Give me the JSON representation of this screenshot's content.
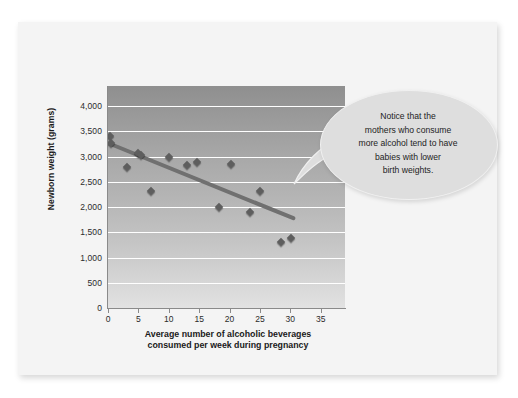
{
  "chart_data": {
    "type": "scatter",
    "title": "",
    "xlabel": "Average number of alcoholic beverages consumed per week during pregnancy",
    "xlabel_line1": "Average number of alcoholic beverages",
    "xlabel_line2": "consumed per week during pregnancy",
    "ylabel": "Newborn weight (grams)",
    "xlim": [
      0,
      39
    ],
    "ylim": [
      0,
      4400
    ],
    "grid": true,
    "legend": null,
    "x_ticks": [
      0,
      5,
      10,
      15,
      20,
      25,
      30,
      35
    ],
    "x_tick_labels": [
      "0",
      "5",
      "10",
      "15",
      "20",
      "25",
      "30",
      "35"
    ],
    "y_ticks": [
      0,
      500,
      1000,
      1500,
      2000,
      2500,
      3000,
      3500,
      4000
    ],
    "y_tick_labels": [
      "0",
      "500",
      "1,000",
      "1,500",
      "2,000",
      "2,500",
      "3,000",
      "3,500",
      "4,000"
    ],
    "points": [
      {
        "x": 0.3,
        "y": 3400
      },
      {
        "x": 0.5,
        "y": 3280
      },
      {
        "x": 3.2,
        "y": 2790
      },
      {
        "x": 5.0,
        "y": 3080
      },
      {
        "x": 5.4,
        "y": 3040
      },
      {
        "x": 7.0,
        "y": 2310
      },
      {
        "x": 10.0,
        "y": 2990
      },
      {
        "x": 13.0,
        "y": 2830
      },
      {
        "x": 14.6,
        "y": 2890
      },
      {
        "x": 18.2,
        "y": 2000
      },
      {
        "x": 20.2,
        "y": 2850
      },
      {
        "x": 23.3,
        "y": 1900
      },
      {
        "x": 25.0,
        "y": 2310
      },
      {
        "x": 28.4,
        "y": 1300
      },
      {
        "x": 30.1,
        "y": 1380
      }
    ],
    "trend_line": {
      "x_start": 0.2,
      "y_start": 3260,
      "x_end": 30.5,
      "y_end": 1780,
      "color": "#707070"
    },
    "colors": {
      "marker": "#5e5e5e",
      "gridline": "#ffffff",
      "plot_bg_top": "#8f8f8f",
      "plot_bg_bottom": "#e2e2e2",
      "axis": "#8a8a8a",
      "card_bg": "#f4f4f4",
      "callout_bg": "#dedede"
    }
  },
  "callout": {
    "lines": [
      "Notice that the",
      "mothers who consume",
      "more alcohol tend to have",
      "babies with lower",
      "birth weights."
    ]
  }
}
